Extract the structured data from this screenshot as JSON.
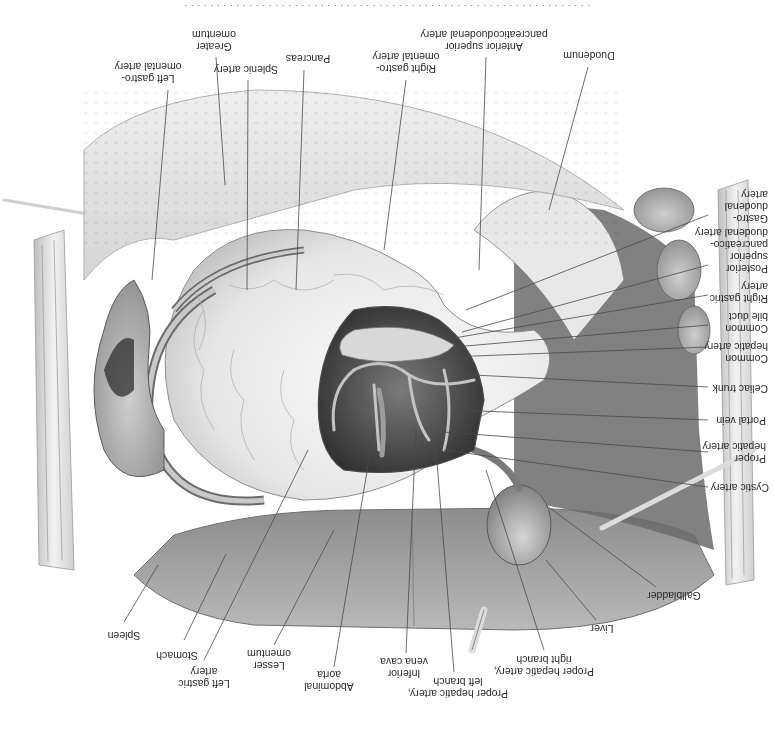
{
  "figure": {
    "orientation": "rotated 180 degrees",
    "caption_visible": "cut off / illegible at top edge",
    "labels": {
      "spleen": "Spleen",
      "stomach": "Stomach",
      "left_gastric_artery": "Left gastric\nartery",
      "lesser_omentum": "Lesser\nomentum",
      "abdominal_aorta": "Abdominal\naorta",
      "inferior_vena_cava": "Inferior\nvena cava",
      "proper_hepatic_left": "Proper hepatic artery,\nleft branch",
      "proper_hepatic_right": "Proper hepatic artery,\nright branch",
      "liver": "Liver",
      "gallbladder": "Gallbladder",
      "cystic_artery": "Cystic artery",
      "proper_hepatic_artery": "Proper\nhepatic artery",
      "portal_vein": "Portal vein",
      "celiac_trunk": "Celiac trunk",
      "common_hepatic_artery": "Common\nhepatic artery",
      "common_bile_duct": "Common\nbile duct",
      "right_gastric_artery": "Right gastric\nartery",
      "posterior_spd_artery": "Posterior\nsuperior\npancreatico-\nduodenal artery",
      "gastroduodenal_artery": "Gastro-\nduodenal\nartery",
      "duodenum": "Duodenum",
      "anterior_spd_artery": "Anterior superior\npancreaticoduodenal artery",
      "right_gastroomental_artery": "Right gastro-\nomental artery",
      "pancreas": "Pancreas",
      "splenic_artery": "Splenic artery",
      "greater_omentum": "Greater\nomentum",
      "left_gastroomental_artery": "Left gastro-\nomental artery"
    },
    "colors": {
      "background": "#ffffff",
      "tissue_light": "#e9e9e9",
      "tissue_mid": "#a8a8a8",
      "tissue_dark": "#5a5a5a",
      "cavity": "#3a3a3a",
      "leader_line": "#4a4a4a",
      "text": "#2a2a2a"
    }
  }
}
